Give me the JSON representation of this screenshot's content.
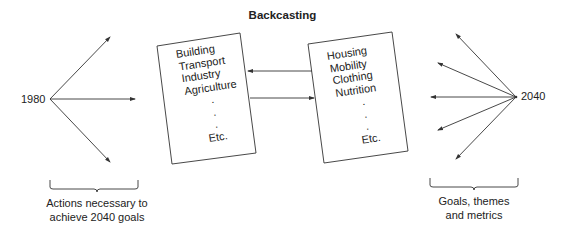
{
  "title": "Backcasting",
  "left": {
    "year": "1980",
    "caption_line1": "Actions necessary to",
    "caption_line2": "achieve 2040 goals"
  },
  "left_box": {
    "items": [
      "Building",
      "Transport",
      "Industry",
      "Agriculture",
      ".",
      ".",
      ".",
      "Etc."
    ]
  },
  "right_box": {
    "items": [
      "Housing",
      "Mobility",
      "Clothing",
      "Nutrition",
      ".",
      ".",
      ".",
      "Etc."
    ]
  },
  "right": {
    "year": "2040",
    "caption_line1": "Goals, themes",
    "caption_line2": "and metrics"
  },
  "colors": {
    "line": "#333333",
    "text": "#222222",
    "background": "#ffffff"
  }
}
